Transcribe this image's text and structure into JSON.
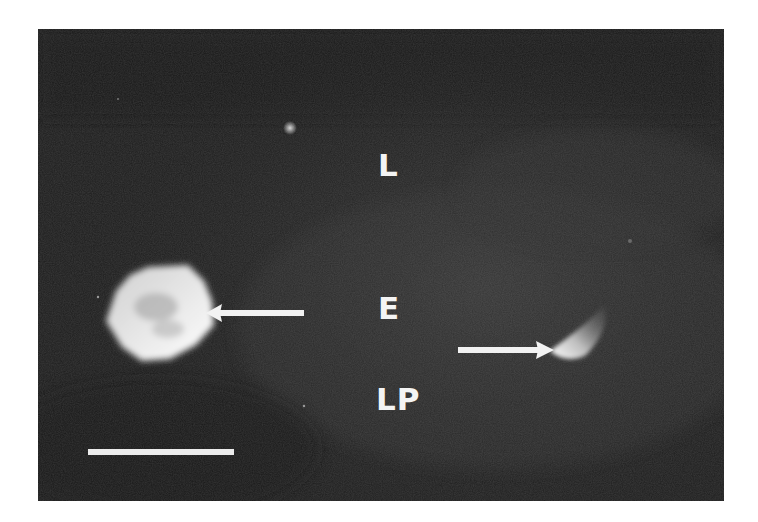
{
  "figure": {
    "type": "fluorescence micrograph",
    "background_color": "#1e1e1e",
    "frame_color": "#ffffff",
    "annotation_color": "#f4f4f4",
    "labels": [
      {
        "id": "L",
        "text": "L",
        "meaning_hint": "top region"
      },
      {
        "id": "E",
        "text": "E",
        "meaning_hint": "middle region"
      },
      {
        "id": "LP",
        "text": "LP",
        "meaning_hint": "bottom region"
      }
    ],
    "arrows": [
      {
        "id": "left-arrow",
        "direction": "left",
        "target": "large bright cell"
      },
      {
        "id": "right-arrow",
        "direction": "right",
        "target": "small comet-shaped cell"
      }
    ],
    "scale_bar": {
      "label": ""
    }
  }
}
